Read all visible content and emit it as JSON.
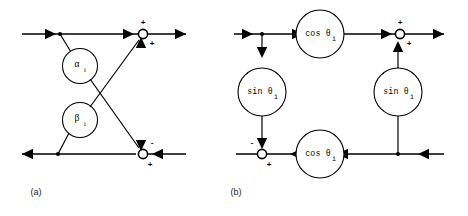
{
  "figure": {
    "background_color": "#ffffff",
    "line_color": "#000000",
    "panels": [
      {
        "id": "a",
        "caption": "(a)",
        "gain_nodes": [
          {
            "name": "alpha-node",
            "symbol": "α",
            "subscript": "i",
            "text": "αi"
          },
          {
            "name": "beta-node",
            "symbol": "β",
            "subscript": "i",
            "text": "βi"
          }
        ],
        "sum_nodes": [
          {
            "name": "top-summing-junction",
            "sign_top": "+",
            "sign_bottom": "+"
          },
          {
            "name": "bottom-summing-junction",
            "sign_top": "-",
            "sign_bottom": "+"
          }
        ]
      },
      {
        "id": "b",
        "caption": "(b)",
        "gain_nodes": [
          {
            "name": "cos-node-top",
            "text": "cos θ",
            "subscript": "i"
          },
          {
            "name": "sin-node-left",
            "text": "sin θ",
            "subscript": "i"
          },
          {
            "name": "sin-node-right",
            "text": "sin θ",
            "subscript": "i"
          },
          {
            "name": "cos-node-bottom",
            "text": "cos θ",
            "subscript": "i"
          }
        ],
        "sum_nodes": [
          {
            "name": "top-summing-junction",
            "sign_top": "+",
            "sign_bottom": "+"
          },
          {
            "name": "bottom-summing-junction",
            "sign_top": "-",
            "sign_bottom": "+"
          }
        ]
      }
    ]
  }
}
